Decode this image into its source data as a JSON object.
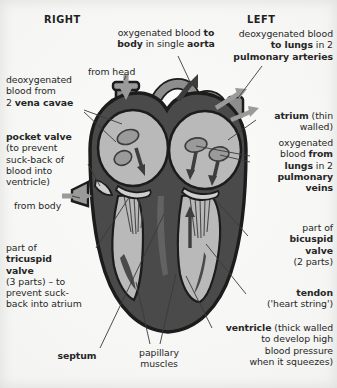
{
  "figure": {
    "background_color": "#f4f4f2",
    "ink_color": "#262626"
  },
  "palette": {
    "muscle_dark": "#4a4a4a",
    "muscle_mid": "#6f6f6f",
    "chamber_light": "#b9b9b9",
    "chamber_pale": "#cfcfcf",
    "vessel_grey": "#8d8d8d",
    "outline": "#1c1c1c",
    "arrow_dark": "#3d3d3d",
    "arrow_light": "#9a9a9a",
    "leader_line": "#3a3a3a"
  },
  "side_headers": {
    "right": "RIGHT",
    "left": "LEFT"
  },
  "labels": [
    {
      "id": "aorta",
      "name": "label-aorta",
      "text_plain": "oxygenated blood to body in single aorta",
      "lines": [
        [
          {
            "t": "oxygenated blood ",
            "b": false
          },
          {
            "t": "to",
            "b": true
          }
        ],
        [
          {
            "t": "body",
            "b": true
          },
          {
            "t": " in single ",
            "b": false
          },
          {
            "t": "aorta",
            "b": true
          }
        ]
      ],
      "align": "center",
      "x": 108,
      "y": 27,
      "w": 116
    },
    {
      "id": "pulmonary_arteries",
      "name": "label-pulmonary-arteries",
      "text_plain": "deoxygenated blood to lungs in 2 pulmonary arteries",
      "lines": [
        [
          {
            "t": "deoxygenated blood",
            "b": false
          }
        ],
        [
          {
            "t": "to lungs",
            "b": true
          },
          {
            "t": " in 2",
            "b": false
          }
        ],
        [
          {
            "t": "pulmonary arteries",
            "b": true
          }
        ]
      ],
      "align": "right",
      "x": 225,
      "y": 28,
      "w": 108
    },
    {
      "id": "from_head",
      "name": "label-from-head",
      "text_plain": "from head",
      "lines": [
        [
          {
            "t": "from head",
            "b": false
          }
        ]
      ],
      "align": "left",
      "x": 88,
      "y": 66,
      "w": 70
    },
    {
      "id": "vena_cavae",
      "name": "label-vena-cavae",
      "text_plain": "deoxygenated blood from 2 vena cavae",
      "lines": [
        [
          {
            "t": "deoxygenated",
            "b": false
          }
        ],
        [
          {
            "t": "blood from",
            "b": false
          }
        ],
        [
          {
            "t": "2 ",
            "b": false
          },
          {
            "t": "vena cavae",
            "b": true
          }
        ]
      ],
      "align": "left",
      "x": 6,
      "y": 74,
      "w": 86
    },
    {
      "id": "atrium",
      "name": "label-atrium",
      "text_plain": "atrium (thin walled)",
      "lines": [
        [
          {
            "t": "atrium",
            "b": true
          },
          {
            "t": " (thin",
            "b": false
          }
        ],
        [
          {
            "t": "walled)",
            "b": false
          }
        ]
      ],
      "align": "right",
      "x": 255,
      "y": 110,
      "w": 78
    },
    {
      "id": "pocket_valve",
      "name": "label-pocket-valve",
      "text_plain": "pocket valve (to prevent suck-back of blood into ventricle)",
      "lines": [
        [
          {
            "t": "pocket valve",
            "b": true
          }
        ],
        [
          {
            "t": "(to prevent",
            "b": false
          }
        ],
        [
          {
            "t": "suck-back of",
            "b": false
          }
        ],
        [
          {
            "t": "blood into",
            "b": false
          }
        ],
        [
          {
            "t": "ventricle)",
            "b": false
          }
        ]
      ],
      "align": "left",
      "x": 6,
      "y": 131,
      "w": 84
    },
    {
      "id": "pulmonary_veins",
      "name": "label-pulmonary-veins",
      "text_plain": "oxygenated blood from lungs in 2 pulmonary veins",
      "lines": [
        [
          {
            "t": "oxygenated",
            "b": false
          }
        ],
        [
          {
            "t": "blood ",
            "b": false
          },
          {
            "t": "from",
            "b": true
          }
        ],
        [
          {
            "t": "lungs",
            "b": true
          },
          {
            "t": " in 2",
            "b": false
          }
        ],
        [
          {
            "t": "pulmonary",
            "b": true
          }
        ],
        [
          {
            "t": "veins",
            "b": true
          }
        ]
      ],
      "align": "right",
      "x": 252,
      "y": 137,
      "w": 81
    },
    {
      "id": "from_body",
      "name": "label-from-body",
      "text_plain": "from body",
      "lines": [
        [
          {
            "t": "from body",
            "b": false
          }
        ]
      ],
      "align": "left",
      "x": 14,
      "y": 200,
      "w": 70
    },
    {
      "id": "bicuspid_valve",
      "name": "label-bicuspid-valve",
      "text_plain": "part of bicuspid valve (2 parts)",
      "lines": [
        [
          {
            "t": "part of",
            "b": false
          }
        ],
        [
          {
            "t": "bicuspid",
            "b": true
          }
        ],
        [
          {
            "t": "valve",
            "b": true
          }
        ],
        [
          {
            "t": "(2 parts)",
            "b": false
          }
        ]
      ],
      "align": "right",
      "x": 250,
      "y": 222,
      "w": 83
    },
    {
      "id": "tricuspid_valve",
      "name": "label-tricuspid-valve",
      "text_plain": "part of tricuspid valve (3 parts) – to prevent suck-back into atrium",
      "lines": [
        [
          {
            "t": "part of",
            "b": false
          }
        ],
        [
          {
            "t": "tricuspid",
            "b": true
          }
        ],
        [
          {
            "t": "valve",
            "b": true
          }
        ],
        [
          {
            "t": "(3 parts) – to",
            "b": false
          }
        ],
        [
          {
            "t": "prevent suck-",
            "b": false
          }
        ],
        [
          {
            "t": "back into atrium",
            "b": false
          }
        ]
      ],
      "align": "left",
      "x": 6,
      "y": 242,
      "w": 92
    },
    {
      "id": "tendon",
      "name": "label-tendon",
      "text_plain": "tendon ('heart string')",
      "lines": [
        [
          {
            "t": "tendon",
            "b": true
          }
        ],
        [
          {
            "t": "('heart string')",
            "b": false
          }
        ]
      ],
      "align": "right",
      "x": 248,
      "y": 287,
      "w": 85
    },
    {
      "id": "ventricle",
      "name": "label-ventricle",
      "text_plain": "ventricle (thick walled to develop high blood pressure when it squeezes)",
      "lines": [
        [
          {
            "t": "ventricle",
            "b": true
          },
          {
            "t": " (thick walled",
            "b": false
          }
        ],
        [
          {
            "t": "to develop high",
            "b": false
          }
        ],
        [
          {
            "t": "blood pressure",
            "b": false
          }
        ],
        [
          {
            "t": "when it squeezes)",
            "b": false
          }
        ]
      ],
      "align": "right",
      "x": 202,
      "y": 322,
      "w": 131
    },
    {
      "id": "septum",
      "name": "label-septum",
      "text_plain": "septum",
      "lines": [
        [
          {
            "t": "septum",
            "b": true
          }
        ]
      ],
      "align": "center",
      "x": 46,
      "y": 350,
      "w": 62
    },
    {
      "id": "papillary_muscles",
      "name": "label-papillary-muscles",
      "text_plain": "papillary muscles",
      "lines": [
        [
          {
            "t": "papillary",
            "b": false
          }
        ],
        [
          {
            "t": "muscles",
            "b": false
          }
        ]
      ],
      "align": "center",
      "x": 124,
      "y": 347,
      "w": 70
    }
  ],
  "anatomy_parts": [
    "aorta",
    "pulmonary artery",
    "vena cava",
    "pulmonary vein",
    "right atrium",
    "left atrium",
    "right ventricle",
    "left ventricle",
    "tricuspid valve",
    "bicuspid valve",
    "pocket valve",
    "septum",
    "papillary muscles",
    "tendons"
  ],
  "flow_arrows": [
    {
      "id": "in-from-head",
      "tone": "light",
      "direction": "down"
    },
    {
      "id": "in-from-body",
      "tone": "light",
      "direction": "right"
    },
    {
      "id": "out-aorta",
      "tone": "dark",
      "direction": "up-right"
    },
    {
      "id": "out-pulmonary-artery-upper",
      "tone": "light",
      "direction": "up-right"
    },
    {
      "id": "out-pulmonary-artery-lower",
      "tone": "light",
      "direction": "right"
    },
    {
      "id": "right-atrium-to-ventricle",
      "tone": "dark",
      "direction": "down"
    },
    {
      "id": "left-atrium-to-ventricle-a",
      "tone": "dark",
      "direction": "down"
    },
    {
      "id": "left-atrium-to-ventricle-b",
      "tone": "dark",
      "direction": "down"
    },
    {
      "id": "left-ventricle-up",
      "tone": "dark",
      "direction": "up"
    }
  ]
}
